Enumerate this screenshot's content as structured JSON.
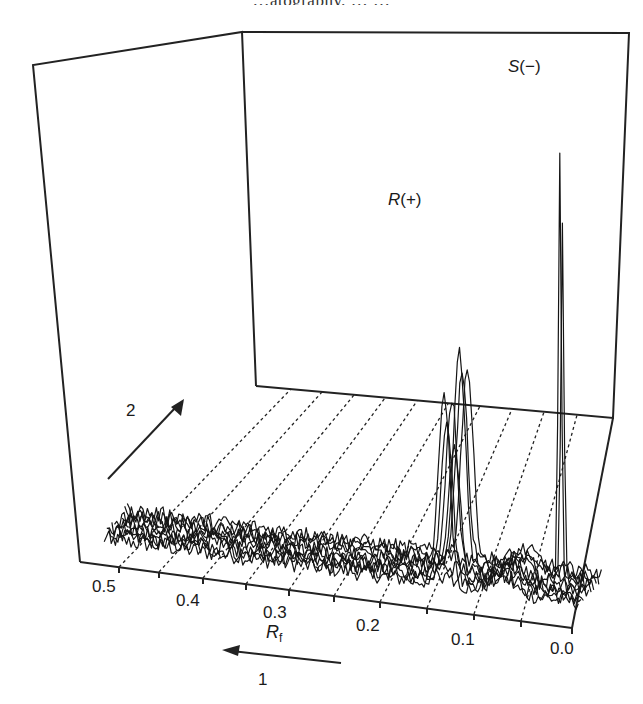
{
  "top_caption_fragment": "…atography, … …",
  "chart_data": {
    "type": "line",
    "subtype": "3d-stacked-chromatograms",
    "title": "",
    "xlabel": "R_f",
    "xlabel_main": "R",
    "xlabel_sub": "f",
    "x_ticks": [
      "0.5",
      "0.4",
      "0.3",
      "0.2",
      "0.1",
      "0.0"
    ],
    "x_range": [
      0.55,
      0.0
    ],
    "x_direction_note": "R_f decreases left-to-right (0.5 on left, 0.0 on right)",
    "depth_axis_label": "2",
    "direction_arrow_1_label": "1",
    "grid": "dashed lines across floor at every 0.05 R_f",
    "n_traces": 10,
    "annotations": [
      {
        "label": "R(+)",
        "label_main": "R",
        "label_sign": "(+)",
        "rf": 0.15,
        "relative_height": 0.55
      },
      {
        "label": "S(−)",
        "label_main": "S",
        "label_sign": "(−)",
        "rf": 0.035,
        "relative_height": 1.0
      }
    ],
    "series_description": "Stack of ~10 noisy densitometric traces; broad baseline hump around Rf 0.5–0.2; sharp peak R(+) near Rf 0.15 in several traces; tallest sharp peak S(−) near Rf 0.035; small rise near Rf 0.08."
  },
  "labels": {
    "peak_r": "R",
    "peak_r_sign": "(+)",
    "peak_s": "S",
    "peak_s_sign": "(−)",
    "axis_rf_main": "R",
    "axis_rf_sub": "f",
    "arrow_1": "1",
    "arrow_2": "2",
    "tick_05": "0.5",
    "tick_04": "0.4",
    "tick_03": "0.3",
    "tick_02": "0.2",
    "tick_01": "0.1",
    "tick_00": "0.0"
  }
}
